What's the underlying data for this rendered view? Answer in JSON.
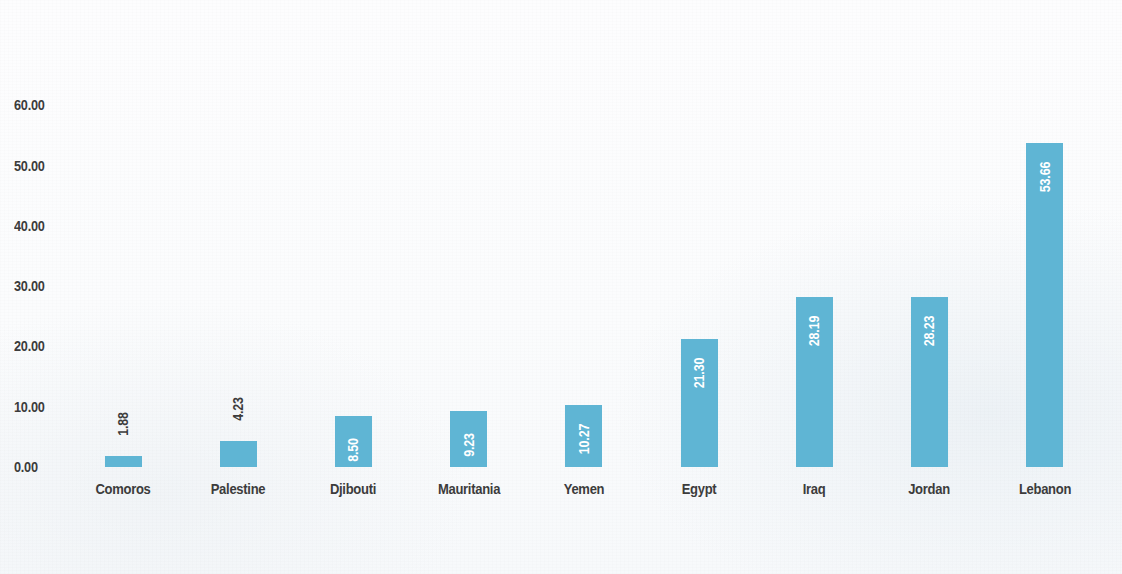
{
  "chart_data": {
    "type": "bar",
    "title": "",
    "subtitle": "",
    "xlabel": "",
    "ylabel": "",
    "orientation": "vertical",
    "grid": false,
    "legend": null,
    "ylim": [
      0,
      60
    ],
    "y_ticks": [
      "0.00",
      "10.00",
      "20.00",
      "30.00",
      "40.00",
      "50.00",
      "60.00"
    ],
    "y_tick_values": [
      0,
      10,
      20,
      30,
      40,
      50,
      60
    ],
    "bar_color": "#5fb5d4",
    "label_color_inside": "#ffffff",
    "label_color_outside": "#3c3c3c",
    "axis_text_color": "#3c3c3c",
    "background_color": "#fbfcfd",
    "categories": [
      "Comoros",
      "Palestine",
      "Djibouti",
      "Mauritania",
      "Yemen",
      "Egypt",
      "Iraq",
      "Jordan",
      "Lebanon"
    ],
    "values": [
      1.88,
      4.23,
      8.5,
      9.23,
      10.27,
      21.3,
      28.19,
      28.23,
      53.66
    ],
    "value_labels": [
      "1.88",
      "4.23",
      "8.50",
      "9.23",
      "10.27",
      "21.30",
      "28.19",
      "28.23",
      "53.66"
    ],
    "label_placement": [
      "outside",
      "outside",
      "inside",
      "inside",
      "inside",
      "inside",
      "inside",
      "inside",
      "inside"
    ],
    "label_rotation_deg": -90
  }
}
